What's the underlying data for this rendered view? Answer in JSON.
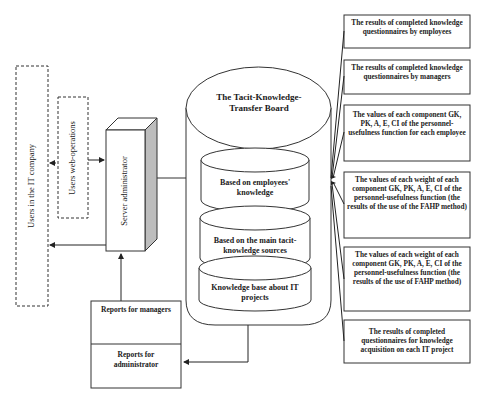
{
  "diagram": {
    "actors": {
      "users_company": "Users in the IT company",
      "users_web_operations": "Users web-operations",
      "server_administrator": "Server administrator"
    },
    "board": {
      "title": "The Tacit-Knowledge-Transfer Board",
      "databases": [
        {
          "label": "Based on employees' knowledge"
        },
        {
          "label": "Based on the main tacit-knowledge sources"
        },
        {
          "label": "Knowledge base about IT projects"
        }
      ]
    },
    "reports": {
      "managers": "Reports for managers",
      "administrator": "Reports for administrator"
    },
    "inputs": [
      {
        "label": "The results of completed knowledge questionnaires by employees"
      },
      {
        "label": "The results of completed knowledge questionnaires by managers"
      },
      {
        "label": "The values of each component GK, PK, A, E, CI of the personnel-usefulness function for each employee"
      },
      {
        "label": "The values of each weight of each component GK, PK, A, E, CI of the personnel-usefulness function (the results of the use of the FAHP method)"
      },
      {
        "label": "The values of each weight of each component GK, PK, A, E, CI of the personnel-usefulness function (the results of the use of FAHP method)"
      },
      {
        "label": "The results of completed questionnaires for knowledge acquisition on each IT project"
      }
    ]
  }
}
